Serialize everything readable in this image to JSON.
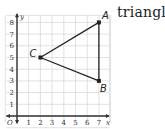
{
  "caption_word": "triangle",
  "axes": {
    "x_label": "x",
    "y_label": "y",
    "origin_label": "O",
    "x_ticks": [
      "1",
      "2",
      "3",
      "4",
      "5",
      "6",
      "7"
    ],
    "y_ticks": [
      "1",
      "2",
      "3",
      "4",
      "5",
      "6",
      "7",
      "8"
    ],
    "x_range": [
      0,
      7.5
    ],
    "y_range": [
      0,
      8.5
    ],
    "grid": true
  },
  "points": [
    {
      "name": "A",
      "x": 7,
      "y": 8
    },
    {
      "name": "B",
      "x": 7,
      "y": 3
    },
    {
      "name": "C",
      "x": 2,
      "y": 5
    }
  ],
  "segments": [
    [
      "A",
      "B"
    ],
    [
      "B",
      "C"
    ],
    [
      "C",
      "A"
    ]
  ],
  "colors": {
    "grid": "#d9d9d9",
    "axis": "#333333",
    "triangle": "#222222"
  }
}
